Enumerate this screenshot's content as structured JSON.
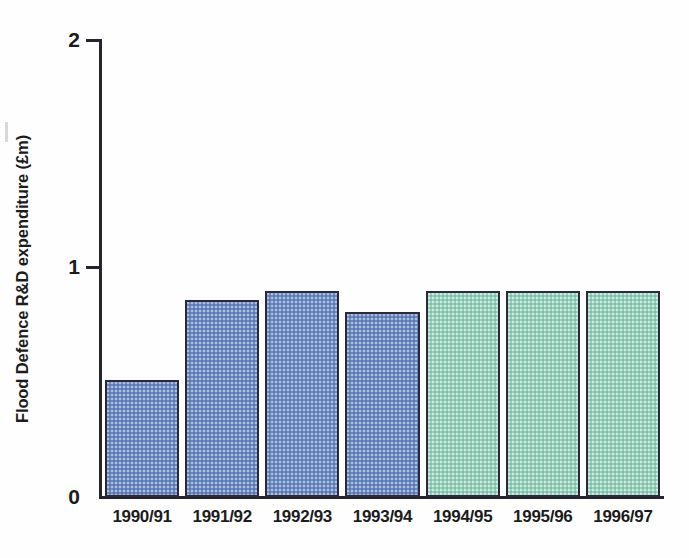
{
  "chart_data": {
    "type": "bar",
    "title": "",
    "xlabel": "",
    "ylabel": "Flood Defence R&D expenditure (£m)",
    "ylim": [
      0,
      2
    ],
    "yticks": [
      "0",
      "1",
      "2"
    ],
    "grid": false,
    "legend": "none",
    "categories": [
      "1990/91",
      "1991/92",
      "1992/93",
      "1993/94",
      "1994/95",
      "1995/96",
      "1996/97"
    ],
    "values": [
      0.51,
      0.86,
      0.9,
      0.81,
      0.9,
      0.9,
      0.9
    ],
    "bar_colors": [
      "#6e8dc4",
      "#6e8dc4",
      "#6e8dc4",
      "#6e8dc4",
      "#97d0bb",
      "#97d0bb",
      "#97d0bb"
    ],
    "bar_series": [
      "blue",
      "blue",
      "blue",
      "blue",
      "green",
      "green",
      "green"
    ],
    "bar_outline_color": "#2a2a3a",
    "axis_color": "#25252d",
    "background_color": "#fefefe"
  }
}
